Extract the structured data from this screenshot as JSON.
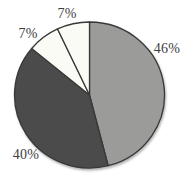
{
  "figure": {
    "background_color": "#ffffff"
  },
  "chart_data": {
    "type": "pie",
    "title": "",
    "legend": "none",
    "direction": "clockwise",
    "start_angle_deg": 0,
    "outline_color": "#383838",
    "label_color": "#3d3d3d",
    "geometry": {
      "cx": 89.5,
      "cy": 95,
      "rx": 75,
      "ry": 73
    },
    "slices": [
      {
        "label": "46%",
        "value": 46,
        "color": "#9b9b99",
        "label_pos": {
          "x": 167,
          "y": 49
        }
      },
      {
        "label": "40%",
        "value": 40,
        "color": "#4b4b4b",
        "label_pos": {
          "x": 26,
          "y": 155
        }
      },
      {
        "label": "7%",
        "value": 7,
        "color": "#fbfbf5",
        "label_pos": {
          "x": 28,
          "y": 34
        }
      },
      {
        "label": "7%",
        "value": 7,
        "color": "#fbfbf5",
        "label_pos": {
          "x": 67,
          "y": 14
        }
      }
    ]
  }
}
